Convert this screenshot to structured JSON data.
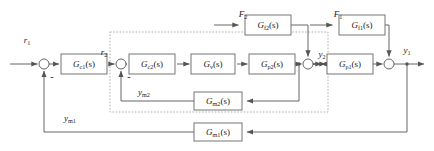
{
  "diagram": {
    "type": "control-block-diagram",
    "colors": {
      "stroke": "#555555",
      "block_fill": "#ffffff",
      "block_stroke": "#666666",
      "dashed_stroke": "#999999",
      "text": "#1a1a1a",
      "background": "#ffffff"
    }
  },
  "blocks": [
    {
      "id": "gc1",
      "name": "G",
      "sub": "c1",
      "arg": "(s)",
      "x": 84,
      "y": 64,
      "w": 46,
      "h": 20
    },
    {
      "id": "gc2",
      "name": "G",
      "sub": "c2",
      "arg": "(s)",
      "x": 152,
      "y": 64,
      "w": 46,
      "h": 20
    },
    {
      "id": "gv",
      "name": "G",
      "sub": "v",
      "arg": "(s)",
      "x": 213,
      "y": 64,
      "w": 44,
      "h": 20
    },
    {
      "id": "gp2",
      "name": "G",
      "sub": "p2",
      "arg": "(s)",
      "x": 272,
      "y": 64,
      "w": 46,
      "h": 20
    },
    {
      "id": "gp1",
      "name": "G",
      "sub": "p1",
      "arg": "(s)",
      "x": 350,
      "y": 64,
      "w": 46,
      "h": 20
    },
    {
      "id": "gf2",
      "name": "G",
      "sub": "f2",
      "arg": "(s)",
      "x": 268,
      "y": 25,
      "w": 46,
      "h": 20
    },
    {
      "id": "gf1",
      "name": "G",
      "sub": "f1",
      "arg": "(s)",
      "x": 362,
      "y": 25,
      "w": 46,
      "h": 20
    },
    {
      "id": "gm2",
      "name": "G",
      "sub": "m2",
      "arg": "(s)",
      "x": 218,
      "y": 101,
      "w": 48,
      "h": 18
    },
    {
      "id": "gm1",
      "name": "G",
      "sub": "m1",
      "arg": "(s)",
      "x": 218,
      "y": 132,
      "w": 48,
      "h": 18
    }
  ],
  "signals": [
    {
      "id": "r1",
      "name": "r",
      "sub": "1",
      "x": 27,
      "y": 40
    },
    {
      "id": "r2",
      "name": "r",
      "sub": "2",
      "x": 104,
      "y": 52
    },
    {
      "id": "y2",
      "name": "y",
      "sub": "2",
      "x": 322,
      "y": 54
    },
    {
      "id": "y1",
      "name": "y",
      "sub": "1",
      "x": 407,
      "y": 50
    },
    {
      "id": "F2",
      "name": "F",
      "sub": "2",
      "x": 243,
      "y": 14
    },
    {
      "id": "F1",
      "name": "F",
      "sub": "1",
      "x": 338,
      "y": 14
    },
    {
      "id": "ym2",
      "name": "y",
      "sub": "m2",
      "x": 144,
      "y": 92
    },
    {
      "id": "ym1",
      "name": "y",
      "sub": "m1",
      "x": 70,
      "y": 118
    }
  ],
  "summing_junctions": [
    {
      "id": "sum1",
      "x": 44,
      "y": 64,
      "r": 5,
      "sign": "-",
      "sign_x": 52,
      "sign_y": 77
    },
    {
      "id": "sum2",
      "x": 121,
      "y": 64,
      "r": 5,
      "sign": "-",
      "sign_x": 129,
      "sign_y": 77
    },
    {
      "id": "sum3",
      "x": 308,
      "y": 64,
      "r": 5,
      "sign": "",
      "sign_x": 0,
      "sign_y": 0
    },
    {
      "id": "sum4",
      "x": 389,
      "y": 64,
      "r": 5,
      "sign": "",
      "sign_x": 0,
      "sign_y": 0
    }
  ],
  "inner_loop_boundary": {
    "x": 110,
    "y": 32,
    "w": 218,
    "h": 80,
    "style": "dotted"
  }
}
